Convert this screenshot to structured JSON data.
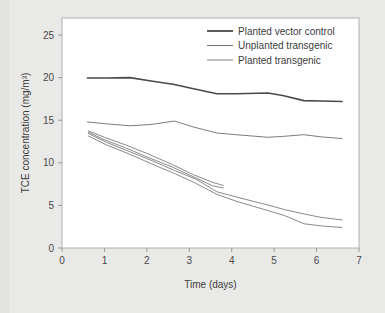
{
  "chart_data": {
    "type": "line",
    "title": "",
    "xlabel": "Time (days)",
    "ylabel": "TCE concentration (mg/m3)",
    "ylabel_display": "TCE concentration (mg/m³)",
    "xlim": [
      0,
      7
    ],
    "ylim": [
      0,
      27
    ],
    "xticks": [
      0,
      1,
      2,
      3,
      4,
      5,
      6,
      7
    ],
    "yticks": [
      0,
      5,
      10,
      15,
      20,
      25
    ],
    "xtick_labels": [
      "0",
      "1",
      "2",
      "3",
      "4",
      "5",
      "6",
      "7"
    ],
    "ytick_labels": [
      "0",
      "5",
      "10",
      "15",
      "20",
      "25"
    ],
    "grid": false,
    "legend_position": "top-right",
    "legend": [
      {
        "label": "Planted vector control",
        "color": "#4a4a4a"
      },
      {
        "label": "Unplanted transgenic",
        "color": "#777777"
      },
      {
        "label": "Planted transgenic",
        "color": "#8a8a8a"
      }
    ],
    "series": [
      {
        "name": "Planted vector control",
        "color": "#4a4a4a",
        "width": 1.6,
        "x": [
          0.6,
          1.05,
          1.6,
          2.1,
          2.65,
          3.1,
          3.65,
          4.1,
          4.85,
          5.2,
          5.7,
          6.1,
          6.6
        ],
        "y": [
          19.95,
          19.95,
          20.0,
          19.6,
          19.2,
          18.7,
          18.1,
          18.1,
          18.2,
          17.9,
          17.3,
          17.25,
          17.2
        ]
      },
      {
        "name": "Unplanted transgenic",
        "color": "#7d7d7d",
        "width": 1.0,
        "x": [
          0.6,
          1.1,
          1.6,
          2.1,
          2.65,
          3.1,
          3.65,
          4.1,
          4.85,
          5.2,
          5.7,
          6.1,
          6.6
        ],
        "y": [
          14.8,
          14.55,
          14.35,
          14.5,
          14.9,
          14.2,
          13.5,
          13.3,
          13.0,
          13.1,
          13.3,
          13.05,
          12.85
        ]
      },
      {
        "name": "Planted transgenic replicate 1",
        "color": "#8a8a8a",
        "width": 1.0,
        "x": [
          0.62,
          1.0,
          1.5,
          2.05,
          2.6,
          3.1,
          3.55,
          3.8
        ],
        "y": [
          13.75,
          13.0,
          12.1,
          11.0,
          9.8,
          8.6,
          7.7,
          7.35
        ]
      },
      {
        "name": "Planted transgenic replicate 2",
        "color": "#8a8a8a",
        "width": 1.0,
        "x": [
          0.62,
          1.0,
          1.5,
          2.05,
          2.6,
          3.1,
          3.55,
          3.8
        ],
        "y": [
          13.6,
          12.7,
          11.75,
          10.6,
          9.5,
          8.35,
          7.3,
          7.05
        ]
      },
      {
        "name": "Planted transgenic replicate 3",
        "color": "#8a8a8a",
        "width": 1.0,
        "x": [
          0.62,
          1.05,
          1.6,
          2.1,
          2.65,
          3.15,
          3.65,
          4.1,
          4.85,
          5.25,
          5.7,
          6.1,
          6.6
        ],
        "y": [
          13.45,
          12.4,
          11.3,
          10.3,
          9.1,
          8.1,
          6.6,
          6.0,
          5.05,
          4.5,
          4.0,
          3.6,
          3.3
        ]
      },
      {
        "name": "Planted transgenic replicate 4",
        "color": "#8a8a8a",
        "width": 1.0,
        "x": [
          0.62,
          1.05,
          1.6,
          2.1,
          2.65,
          3.15,
          3.65,
          4.1,
          4.85,
          5.25,
          5.7,
          6.1,
          6.6
        ],
        "y": [
          13.15,
          12.1,
          11.0,
          9.9,
          8.75,
          7.6,
          6.3,
          5.5,
          4.4,
          3.8,
          2.85,
          2.6,
          2.4
        ]
      }
    ]
  }
}
